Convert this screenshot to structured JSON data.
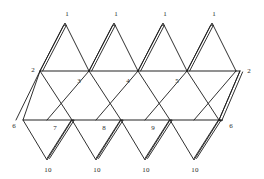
{
  "figure": {
    "kind": "icosahedron-net",
    "colors": {
      "background": "#ffffff",
      "edge": "#1a1a1a",
      "fold_line": "#6d6d6d",
      "label": "#2a2a2a"
    },
    "geometry": {
      "view_width": 264,
      "view_height": 179,
      "row_top_apex_y": 23,
      "row_upper_y": 71,
      "row_lower_y": 120,
      "row_bottom_y": 160,
      "cell_half_width": 25,
      "left_margin_x": 16
    }
  },
  "labels": {
    "top_row": [
      {
        "text": "1",
        "x": 67,
        "y": 14
      },
      {
        "text": "1",
        "x": 116,
        "y": 14
      },
      {
        "text": "1",
        "x": 165,
        "y": 14
      },
      {
        "text": "1",
        "x": 214,
        "y": 14
      }
    ],
    "upper_row": [
      {
        "text": "2",
        "x": 33,
        "y": 70
      },
      {
        "text": "3",
        "x": 79,
        "y": 81
      },
      {
        "text": "4",
        "x": 128,
        "y": 81
      },
      {
        "text": "5",
        "x": 177,
        "y": 81
      },
      {
        "text": "2",
        "x": 249,
        "y": 71
      }
    ],
    "lower_row": [
      {
        "text": "6",
        "x": 14,
        "y": 126
      },
      {
        "text": "7",
        "x": 55,
        "y": 128
      },
      {
        "text": "8",
        "x": 104,
        "y": 128
      },
      {
        "text": "9",
        "x": 153,
        "y": 128
      },
      {
        "text": "6",
        "x": 231,
        "y": 126
      }
    ],
    "bottom_row": [
      {
        "text": "10",
        "x": 48,
        "y": 170
      },
      {
        "text": "10",
        "x": 97,
        "y": 170
      },
      {
        "text": "10",
        "x": 146,
        "y": 170
      },
      {
        "text": "10",
        "x": 195,
        "y": 170
      }
    ]
  },
  "fold_lines": {
    "upper_horizontal": {
      "x1": 40,
      "y1": 71,
      "x2": 240,
      "y2": 71
    },
    "lower_horizontal": {
      "x1": 23,
      "y1": 120,
      "x2": 223,
      "y2": 120
    }
  },
  "edges": {
    "upper_zigzag": "M 16,120 L 40,71 L 65,23 L 89,71 L 114,23 L 138,71 L 163,23 L 187,71 L 212,23 L 236,71",
    "lower_zigzag": "M 23,120 L 47,160 L 72,120 L 96,160 L 121,120 L 145,160 L 170,120 L 194,160 L 219,120 L 240,71",
    "upper_to_lower_left": "M 40,71 L 23,120",
    "mid_diagonals": [
      "M 40,71 L 72,120",
      "M 89,71 L 121,120",
      "M 138,71 L 170,120",
      "M 187,71 L 219,120",
      "M 89,71 L 47,120",
      "M 138,71 L 96,120",
      "M 187,71 L 145,120",
      "M 236,71 L 194,120"
    ]
  },
  "tabs": {
    "description": "doubled glue-flap outlines",
    "top_tabs": [
      "M 40,71 L 65,23",
      "M 89,71 L 114,23",
      "M 138,71 L 163,23",
      "M 187,71 L 212,23"
    ],
    "bottom_tabs": [
      "M 47,160 L 72,120",
      "M 96,160 L 121,120",
      "M 145,160 L 170,120",
      "M 194,160 L 219,120"
    ],
    "right_tab": "M 240,71 L 219,120"
  }
}
